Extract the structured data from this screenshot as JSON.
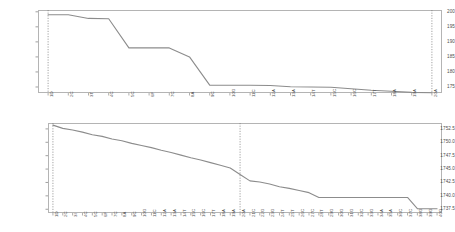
{
  "chart_data": [
    {
      "id": "top",
      "type": "line",
      "title": "",
      "xlabel": "",
      "ylabel": "",
      "ylim": [
        173.0,
        200.6
      ],
      "yticks": [
        200,
        195,
        190,
        185,
        180,
        175
      ],
      "ytick_labels": [
        "200",
        "195",
        "190",
        "185",
        "180",
        "175"
      ],
      "grid": false,
      "legend": "none",
      "line_color": "#8c8c8c",
      "categories": [
        "1D",
        "2C",
        "3T",
        "4C",
        "5C",
        "6F",
        "7C",
        "8A",
        "9C",
        "10G",
        "11C",
        "12A",
        "13A",
        "14T",
        "15C",
        "16C",
        "17T",
        "18A",
        "19A",
        "20A"
      ],
      "values": [
        199.0,
        199.0,
        197.8,
        197.7,
        188.0,
        188.0,
        188.0,
        185.0,
        175.6,
        175.6,
        175.6,
        175.5,
        175.1,
        175.0,
        174.9,
        174.4,
        173.9,
        173.6,
        173.2,
        173.1
      ],
      "markers": [
        {
          "at_category": "1D",
          "style": "dotted",
          "color": "#7a7a7a"
        },
        {
          "at_category": "20A",
          "style": "dotted",
          "color": "#7a7a7a"
        }
      ]
    },
    {
      "id": "bottom",
      "type": "line",
      "title": "",
      "xlabel": "",
      "ylabel": "",
      "ylim": [
        1736.8,
        1753.6
      ],
      "yticks": [
        1752.5,
        1750.0,
        1747.5,
        1745.0,
        1742.5,
        1740.0,
        1737.5
      ],
      "ytick_labels": [
        "1752.5",
        "1750.0",
        "1747.5",
        "1745.0",
        "1742.5",
        "1740.0",
        "1737.5"
      ],
      "grid": false,
      "legend": "none",
      "line_color": "#8c8c8c",
      "categories": [
        "1D",
        "2C",
        "3I",
        "4C",
        "5C",
        "6F",
        "7C",
        "8A",
        "9C",
        "10G",
        "11C",
        "12A",
        "13A",
        "14T",
        "15C",
        "16C",
        "17T",
        "18A",
        "19A",
        "20A",
        "21C",
        "22G",
        "23G",
        "24T",
        "25T",
        "26C",
        "27C",
        "28T",
        "29G",
        "30G",
        "31G",
        "32C",
        "33G",
        "34A",
        "35A",
        "36C",
        "37C",
        "38G",
        "39G",
        "40G"
      ],
      "values": [
        1753.2,
        1752.6,
        1752.3,
        1751.9,
        1751.4,
        1751.1,
        1750.6,
        1750.3,
        1749.8,
        1749.4,
        1749.0,
        1748.5,
        1748.1,
        1747.6,
        1747.1,
        1746.7,
        1746.2,
        1745.7,
        1745.2,
        1744.0,
        1742.8,
        1742.6,
        1742.2,
        1741.7,
        1741.4,
        1741.0,
        1740.6,
        1739.7,
        1739.7,
        1739.7,
        1739.7,
        1739.7,
        1739.7,
        1739.7,
        1739.7,
        1739.7,
        1739.7,
        1737.6,
        1737.6,
        1737.6
      ],
      "markers": [
        {
          "at_category": "1D",
          "style": "dotted",
          "color": "#7a7a7a"
        },
        {
          "at_category": "20A",
          "style": "dotted",
          "color": "#7a7a7a"
        }
      ]
    }
  ]
}
